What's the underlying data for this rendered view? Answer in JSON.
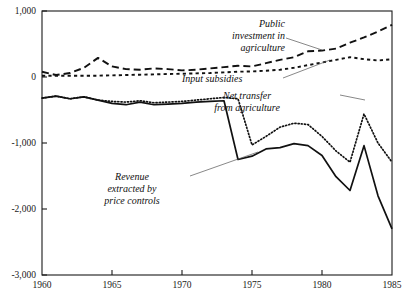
{
  "chart_data": {
    "type": "line",
    "title": "",
    "xlabel": "",
    "ylabel": "",
    "xlim": [
      1960,
      1985
    ],
    "ylim": [
      -3000,
      1000
    ],
    "grid": false,
    "legend_position": "inline-annotations",
    "x_ticks": [
      1960,
      1965,
      1970,
      1975,
      1980,
      1985
    ],
    "x_tick_labels": [
      "1960",
      "1965",
      "1970",
      "1975",
      "1980",
      "1985"
    ],
    "y_ticks": [
      1000,
      0,
      -1000,
      -2000,
      -3000
    ],
    "y_tick_labels": [
      "1,000",
      "0",
      "-1,000",
      "-2,000",
      "-3,000"
    ],
    "x": [
      1960,
      1961,
      1962,
      1963,
      1964,
      1965,
      1966,
      1967,
      1968,
      1969,
      1970,
      1971,
      1972,
      1973,
      1974,
      1975,
      1976,
      1977,
      1978,
      1979,
      1980,
      1981,
      1982,
      1983,
      1984,
      1985
    ],
    "series": [
      {
        "name": "Public investment in agriculture",
        "style": "long-dashed",
        "values": [
          80,
          30,
          60,
          140,
          290,
          160,
          120,
          110,
          130,
          120,
          100,
          110,
          130,
          150,
          170,
          160,
          210,
          260,
          300,
          390,
          400,
          430,
          520,
          600,
          690,
          790
        ]
      },
      {
        "name": "Input subsidies",
        "style": "short-dashed",
        "values": [
          20,
          20,
          20,
          20,
          20,
          25,
          30,
          35,
          40,
          45,
          50,
          55,
          60,
          70,
          80,
          85,
          95,
          110,
          140,
          180,
          220,
          260,
          300,
          270,
          250,
          270
        ]
      },
      {
        "name": "Net transfer from agriculture",
        "style": "dotted",
        "values": [
          -320,
          -290,
          -330,
          -300,
          -350,
          -370,
          -380,
          -360,
          -390,
          -380,
          -370,
          -350,
          -330,
          -310,
          -330,
          -1030,
          -900,
          -760,
          -700,
          -720,
          -900,
          -1120,
          -1290,
          -560,
          -1000,
          -1290
        ]
      },
      {
        "name": "Revenue extracted by price controls",
        "style": "solid",
        "values": [
          -320,
          -290,
          -330,
          -300,
          -350,
          -400,
          -420,
          -380,
          -420,
          -410,
          -400,
          -380,
          -370,
          -360,
          -1250,
          -1200,
          -1090,
          -1070,
          -1010,
          -1040,
          -1190,
          -1510,
          -1720,
          -1040,
          -1800,
          -2300
        ]
      }
    ],
    "annotations": [
      {
        "name": "public-investment-label",
        "text": [
          "Public",
          "investment in",
          "agriculture"
        ]
      },
      {
        "name": "input-subsidies-label",
        "text": [
          "Input subsidies"
        ]
      },
      {
        "name": "net-transfer-label",
        "text": [
          "Net transfer",
          "from agriculture"
        ]
      },
      {
        "name": "revenue-label",
        "text": [
          "Revenue",
          "extracted by",
          "price controls"
        ]
      }
    ]
  }
}
